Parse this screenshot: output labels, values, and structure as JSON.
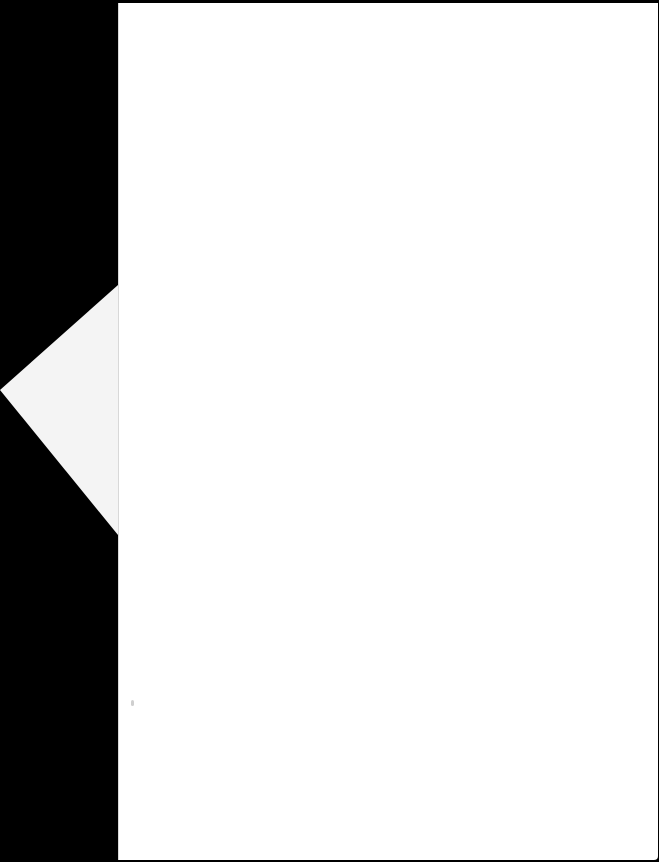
{
  "document": {
    "type": "scanned-page",
    "content": "",
    "colors": {
      "background": "#000000",
      "page": "#ffffff",
      "fold": "#f4f4f4"
    }
  }
}
